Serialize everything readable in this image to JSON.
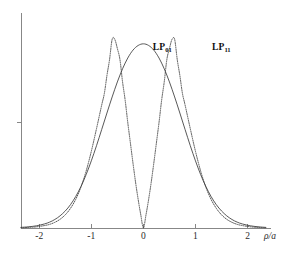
{
  "figure": {
    "background_color": "#ffffff",
    "axis_color": "#7a7a7a",
    "curve_color": "#3a3a3a"
  },
  "chart_data": {
    "type": "line",
    "title": "",
    "subtitle": "",
    "xlabel": "ρ/a",
    "ylabel": "",
    "xlim": [
      -2.35,
      2.45
    ],
    "ylim": [
      0,
      1.06
    ],
    "grid": false,
    "legend_position": "inline-annotations",
    "x_ticks": [
      -2,
      -1,
      0,
      1,
      2
    ],
    "x_tick_labels": [
      "-2",
      "-1",
      "0",
      "1",
      "2"
    ],
    "y_ticks": [
      0.5
    ],
    "y_tick_labels": [
      ""
    ],
    "annotations": [
      {
        "name": "lp01-label",
        "text_main": "LP",
        "text_sub": "01",
        "x": 0.18,
        "y": 0.91
      },
      {
        "name": "lp11-label",
        "text_main": "LP",
        "text_sub": "11",
        "x": 1.32,
        "y": 0.91
      }
    ],
    "series": [
      {
        "name": "LP01",
        "label": "LP₀₁",
        "style": "solid",
        "color": "#3a3a3a",
        "description": "Fundamental mode: single lobe peaking at rho/a = 0",
        "x": [
          -2.35,
          -2.2,
          -2.05,
          -1.9,
          -1.8,
          -1.7,
          -1.6,
          -1.5,
          -1.4,
          -1.3,
          -1.2,
          -1.1,
          -1.0,
          -0.9,
          -0.8,
          -0.7,
          -0.6,
          -0.5,
          -0.4,
          -0.3,
          -0.2,
          -0.1,
          0.0,
          0.1,
          0.2,
          0.3,
          0.4,
          0.5,
          0.6,
          0.7,
          0.8,
          0.9,
          1.0,
          1.1,
          1.2,
          1.3,
          1.4,
          1.5,
          1.6,
          1.7,
          1.8,
          1.9,
          2.05,
          2.2,
          2.35
        ],
        "y": [
          0.003,
          0.006,
          0.011,
          0.02,
          0.029,
          0.042,
          0.06,
          0.084,
          0.115,
          0.155,
          0.204,
          0.263,
          0.331,
          0.406,
          0.486,
          0.567,
          0.646,
          0.72,
          0.785,
          0.838,
          0.877,
          0.9,
          0.908,
          0.9,
          0.877,
          0.838,
          0.785,
          0.72,
          0.646,
          0.567,
          0.486,
          0.406,
          0.331,
          0.263,
          0.204,
          0.155,
          0.115,
          0.084,
          0.06,
          0.042,
          0.029,
          0.02,
          0.011,
          0.006,
          0.003
        ]
      },
      {
        "name": "LP11",
        "label": "LP₁₁",
        "style": "dotted",
        "color": "#3a3a3a",
        "description": "Second-order mode: twin lobes peaking near rho/a = -0.6 and +0.6 with a null at 0",
        "x": [
          -2.35,
          -2.2,
          -2.05,
          -1.9,
          -1.8,
          -1.7,
          -1.6,
          -1.5,
          -1.4,
          -1.3,
          -1.2,
          -1.1,
          -1.0,
          -0.9,
          -0.8,
          -0.75,
          -0.7,
          -0.65,
          -0.6,
          -0.55,
          -0.5,
          -0.45,
          -0.4,
          -0.35,
          -0.3,
          -0.25,
          -0.2,
          -0.15,
          -0.1,
          -0.05,
          0.0,
          0.05,
          0.1,
          0.15,
          0.2,
          0.25,
          0.3,
          0.35,
          0.4,
          0.45,
          0.5,
          0.55,
          0.6,
          0.65,
          0.7,
          0.75,
          0.8,
          0.9,
          1.0,
          1.1,
          1.2,
          1.3,
          1.4,
          1.5,
          1.6,
          1.7,
          1.8,
          1.9,
          2.05,
          2.2,
          2.35
        ],
        "y": [
          0.001,
          0.003,
          0.006,
          0.012,
          0.018,
          0.028,
          0.043,
          0.065,
          0.097,
          0.141,
          0.201,
          0.28,
          0.378,
          0.49,
          0.607,
          0.663,
          0.752,
          0.83,
          0.93,
          0.93,
          0.885,
          0.83,
          0.72,
          0.63,
          0.52,
          0.42,
          0.32,
          0.225,
          0.14,
          0.065,
          0.0,
          0.065,
          0.14,
          0.225,
          0.32,
          0.42,
          0.52,
          0.63,
          0.72,
          0.83,
          0.885,
          0.93,
          0.93,
          0.83,
          0.752,
          0.663,
          0.607,
          0.49,
          0.378,
          0.28,
          0.201,
          0.141,
          0.097,
          0.065,
          0.043,
          0.028,
          0.018,
          0.012,
          0.006,
          0.003,
          0.001
        ]
      }
    ]
  }
}
